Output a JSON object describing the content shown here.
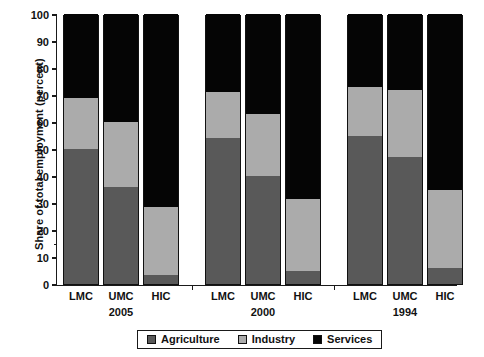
{
  "chart_data": {
    "type": "bar",
    "subtype": "stacked-bar-100",
    "title": "",
    "xlabel": "",
    "ylabel": "Share of total employment (percent)",
    "ylim": [
      0,
      100
    ],
    "ytick_step": 10,
    "ytick_labels": [
      "0",
      "10",
      "20",
      "30",
      "40",
      "50",
      "60",
      "70",
      "80",
      "90",
      "100"
    ],
    "grid": false,
    "legend_position": "bottom",
    "legend_entries": [
      "Agriculture",
      "Industry",
      "Services"
    ],
    "series_colors": {
      "Agriculture": "#595959",
      "Industry": "#ababab",
      "Services": "#050505"
    },
    "groups": [
      {
        "name": "2005",
        "categories": [
          "LMC",
          "UMC",
          "HIC"
        ],
        "bars": [
          {
            "category": "LMC",
            "Agriculture": 50,
            "Industry": 19,
            "Services": 31
          },
          {
            "category": "UMC",
            "Agriculture": 36,
            "Industry": 24,
            "Services": 40
          },
          {
            "category": "HIC",
            "Agriculture": 3.5,
            "Industry": 25,
            "Services": 71.5
          }
        ]
      },
      {
        "name": "2000",
        "categories": [
          "LMC",
          "UMC",
          "HIC"
        ],
        "bars": [
          {
            "category": "LMC",
            "Agriculture": 54,
            "Industry": 17,
            "Services": 29
          },
          {
            "category": "UMC",
            "Agriculture": 40,
            "Industry": 23,
            "Services": 37
          },
          {
            "category": "HIC",
            "Agriculture": 5,
            "Industry": 26.5,
            "Services": 68.5
          }
        ]
      },
      {
        "name": "1994",
        "categories": [
          "LMC",
          "UMC",
          "HIC"
        ],
        "bars": [
          {
            "category": "LMC",
            "Agriculture": 55,
            "Industry": 18,
            "Services": 27
          },
          {
            "category": "UMC",
            "Agriculture": 47,
            "Industry": 25,
            "Services": 28
          },
          {
            "category": "HIC",
            "Agriculture": 6,
            "Industry": 29,
            "Services": 65
          }
        ]
      }
    ]
  }
}
